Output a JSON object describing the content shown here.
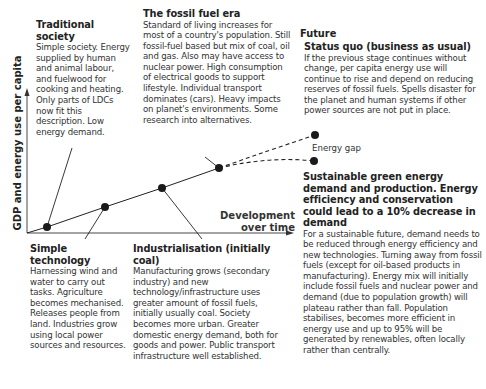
{
  "axes": {
    "y_label": "GDP and energy use per capita",
    "x_label_line1": "Development",
    "x_label_line2": "over time"
  },
  "future_label": "Future",
  "energy_gap_label": "Energy gap",
  "stages": {
    "traditional": {
      "title": "Traditional society",
      "body": "Simple society. Energy supplied by human and animal labour, and fuelwood for cooking and heating. Only parts of LDCs now fit this description. Low energy demand."
    },
    "fossil": {
      "title": "The fossil fuel era",
      "body": "Standard of living increases for most of a country's population. Still fossil-fuel based but mix of coal, oil and gas. Also may have access to nuclear power. High consumption of electrical goods to support lifestyle. Individual transport dominates (cars). Heavy impacts on planet's environments. Some research into alternatives."
    },
    "status_quo": {
      "title": "Status quo (business as usual)",
      "body": "If the previous stage continues without change, per capita energy use will continue to rise and depend on reducing reserves of fossil fuels. Spells disaster for the planet and human systems if other power sources are not put in place."
    },
    "simple_tech": {
      "title": "Simple technology",
      "body": "Harnessing wind and water to carry out tasks. Agriculture becomes mechanised. Releases people from land. Industries grow using local power sources and resources."
    },
    "industrialisation": {
      "title": "Industrialisation (initially coal)",
      "body": "Manufacturing grows (secondary industry) and new technology/infrastructure uses greater amount of fossil fuels, initially usually coal. Society becomes more urban. Greater domestic energy demand, both for goods and power. Public transport infrastructure well established."
    },
    "sustainable": {
      "title": "Sustainable green energy demand and production. Energy efficiency and conservation could lead to a 10% decrease in demand",
      "body": "For a sustainable future, demand needs to be reduced through energy efficiency and new technologies. Turning away from fossil fuels (except for oil-based products in manufacturing). Energy mix will initially include fossil fuels and nuclear power and demand (due to population growth) will plateau rather than fall. Population stabilises, becomes more efficient in energy use and up to 95% will be generated by renewables, often locally rather than centrally."
    }
  },
  "colors": {
    "line": "#222222",
    "dot": "#1a1a1a",
    "text": "#333333"
  }
}
